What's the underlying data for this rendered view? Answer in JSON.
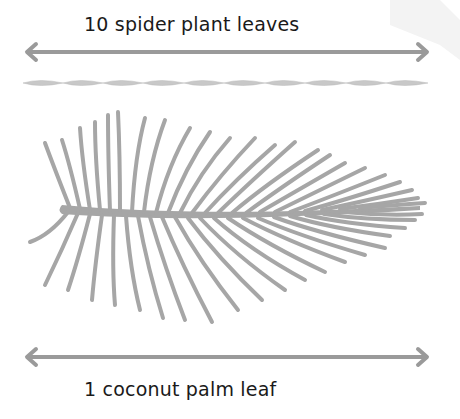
{
  "diagram": {
    "top_label": "10 spider plant leaves",
    "bottom_label": "1 coconut palm leaf",
    "spider_leaf_count": 10,
    "colors": {
      "arrow": "#9a9a9a",
      "leaf_fill": "#a6a6a6",
      "spider_leaf_fill": "#c8c8c8",
      "text": "#1a1a1a",
      "watermark": "#f0f0f0"
    }
  }
}
